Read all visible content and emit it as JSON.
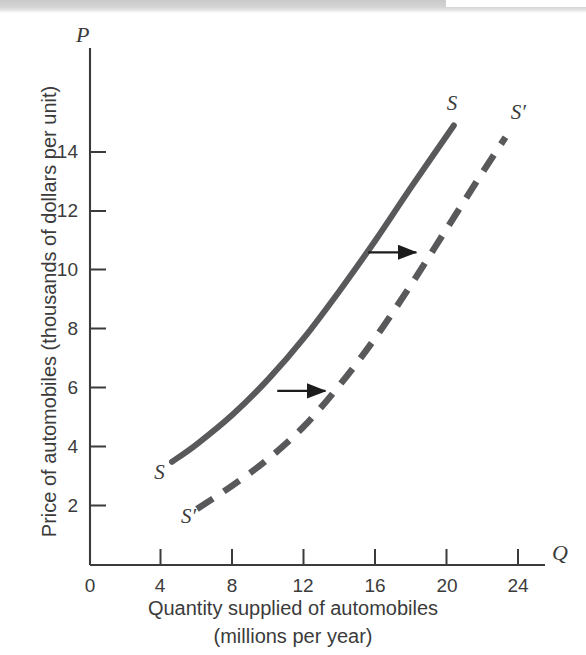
{
  "figure": {
    "background_color": "#ffffff",
    "ink_color": "#3b3b3b",
    "curve_color": "#59595b",
    "axis_color": "#3b3b3b"
  },
  "chart_data": {
    "type": "line",
    "title": "",
    "subtitle": "",
    "xlabel_line1": "Quantity supplied of automobiles",
    "xlabel_line2": "(millions per year)",
    "ylabel": "Price of automobiles (thousands of dollars per unit)",
    "x_axis_variable": "Q",
    "y_axis_variable": "P",
    "xlim": [
      0,
      26
    ],
    "ylim": [
      0,
      16
    ],
    "x_ticks": [
      0,
      4,
      8,
      12,
      16,
      20,
      24
    ],
    "y_ticks": [
      2,
      4,
      6,
      8,
      10,
      12,
      14
    ],
    "x_tick_labels": [
      "0",
      "4",
      "8",
      "12",
      "16",
      "20",
      "24"
    ],
    "y_tick_labels": [
      "2",
      "4",
      "6",
      "8",
      "10",
      "12",
      "14"
    ],
    "grid": false,
    "legend": "none",
    "series": [
      {
        "name": "S",
        "label": "S",
        "style": "solid",
        "description": "Original supply curve, upward sloping and convex",
        "points": [
          {
            "q": 4.6,
            "p": 3.5
          },
          {
            "q": 6.0,
            "p": 4.1
          },
          {
            "q": 8.0,
            "p": 5.1
          },
          {
            "q": 10.0,
            "p": 6.3
          },
          {
            "q": 12.0,
            "p": 7.7
          },
          {
            "q": 14.0,
            "p": 9.3
          },
          {
            "q": 16.0,
            "p": 11.0
          },
          {
            "q": 18.0,
            "p": 12.8
          },
          {
            "q": 20.4,
            "p": 14.9
          }
        ],
        "label_start": {
          "q": 3.6,
          "p": 3.1
        },
        "label_end": {
          "q": 20.0,
          "p": 15.6
        }
      },
      {
        "name": "S'",
        "label": "S′",
        "style": "dashed",
        "description": "New supply curve after a rightward shift in supply",
        "points": [
          {
            "q": 6.0,
            "p": 1.9
          },
          {
            "q": 8.0,
            "p": 2.7
          },
          {
            "q": 10.0,
            "p": 3.6
          },
          {
            "q": 12.0,
            "p": 4.7
          },
          {
            "q": 14.0,
            "p": 6.1
          },
          {
            "q": 16.0,
            "p": 7.7
          },
          {
            "q": 18.0,
            "p": 9.5
          },
          {
            "q": 20.0,
            "p": 11.4
          },
          {
            "q": 22.0,
            "p": 13.3
          },
          {
            "q": 23.3,
            "p": 14.5
          }
        ],
        "label_start": {
          "q": 5.1,
          "p": 1.6
        },
        "label_end": {
          "q": 23.6,
          "p": 15.3
        }
      }
    ],
    "annotations": [
      {
        "name": "shift-arrow-lower",
        "type": "arrow",
        "direction": "right",
        "from": {
          "q": 10.5,
          "p": 5.9
        },
        "to": {
          "q": 13.2,
          "p": 5.9
        },
        "meaning": "supply shifts right at low price"
      },
      {
        "name": "shift-arrow-upper",
        "type": "arrow",
        "direction": "right",
        "from": {
          "q": 15.6,
          "p": 10.6
        },
        "to": {
          "q": 18.3,
          "p": 10.6
        },
        "meaning": "supply shifts right at high price"
      }
    ]
  }
}
